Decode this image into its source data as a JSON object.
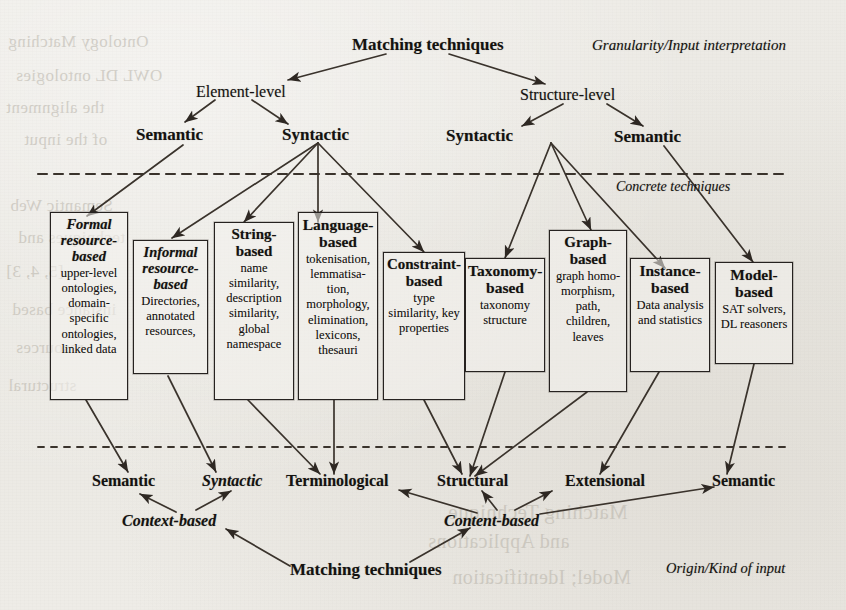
{
  "figure": {
    "top_root": "Matching techniques",
    "bottom_root": "Matching techniques",
    "axis_top_right": "Granularity/Input interpretation",
    "axis_middle_right": "Concrete techniques",
    "axis_bottom_right": "Origin/Kind of input"
  },
  "upper_tree": {
    "level1": [
      {
        "label": "Element-level"
      },
      {
        "label": "Structure-level"
      }
    ],
    "level2": [
      {
        "label": "Semantic"
      },
      {
        "label": "Syntactic"
      },
      {
        "label": "Syntactic"
      },
      {
        "label": "Semantic"
      }
    ]
  },
  "technique_boxes": [
    {
      "title": "Formal resource-based",
      "title_lines": [
        "Formal",
        "resource-",
        "based"
      ],
      "body_lines": [
        "upper-level",
        "ontologies,",
        "domain-",
        "specific",
        "ontologies,",
        "linked data"
      ],
      "style": "bold-italic"
    },
    {
      "title": "Informal resource-based",
      "title_lines": [
        "Informal",
        "resource-",
        "based"
      ],
      "body_lines": [
        "Directories,",
        "annotated",
        "resources,"
      ],
      "style": "bold-italic"
    },
    {
      "title": "String-based",
      "title_lines": [
        "String-",
        "based"
      ],
      "body_lines": [
        "name",
        "similarity,",
        "description",
        "similarity,",
        "global",
        "namespace"
      ],
      "style": "regular"
    },
    {
      "title": "Language-based",
      "title_lines": [
        "Language-",
        "based"
      ],
      "body_lines": [
        "tokenisation,",
        "lemmatisa-",
        "tion,",
        "morphology,",
        "elimination,",
        "lexicons,",
        "thesauri"
      ],
      "style": "bold"
    },
    {
      "title": "Constraint-based",
      "title_lines": [
        "Constraint-",
        "based"
      ],
      "body_lines": [
        "type",
        "similarity, key",
        "properties"
      ],
      "style": "regular"
    },
    {
      "title": "Taxonomy-based",
      "title_lines": [
        "Taxonomy-",
        "based"
      ],
      "body_lines": [
        "taxonomy",
        "structure"
      ],
      "style": "bold"
    },
    {
      "title": "Graph-based",
      "title_lines": [
        "Graph-",
        "based"
      ],
      "body_lines": [
        "graph homo-",
        "morphism,",
        "path,",
        "children,",
        "leaves"
      ],
      "style": "regular"
    },
    {
      "title": "Instance-based",
      "title_lines": [
        "Instance-",
        "based"
      ],
      "body_lines": [
        "Data analysis",
        "and statistics"
      ],
      "style": "bold"
    },
    {
      "title": "Model-based",
      "title_lines": [
        "Model-",
        "based"
      ],
      "body_lines": [
        "SAT solvers,",
        "DL reasoners"
      ],
      "style": "bold"
    }
  ],
  "lower_tree": {
    "level2": [
      {
        "label": "Semantic",
        "style": "bold"
      },
      {
        "label": "Syntactic",
        "style": "bold-italic"
      },
      {
        "label": "Terminological",
        "style": "bold"
      },
      {
        "label": "Structural",
        "style": "bold"
      },
      {
        "label": "Extensional",
        "style": "bold"
      },
      {
        "label": "Semantic",
        "style": "bold"
      }
    ],
    "level1": [
      {
        "label": "Context-based",
        "style": "bold-italic"
      },
      {
        "label": "Content-based",
        "style": "bold-italic"
      }
    ]
  },
  "bleed_through": [
    "Ontology Matching",
    "OWL DL ontologies",
    "the alignment",
    "of the input",
    "Semantic Web",
    "techniques and",
    "[5, 4, 3]",
    "instance based",
    "resources",
    "structural",
    "Matching Technique",
    "and Applications",
    "Model; Identification"
  ],
  "colors": {
    "ink": "#141210",
    "line": "#3a332c",
    "paper": "#eceae5",
    "box_border": "#262220",
    "bleed": "#b9b4aa"
  }
}
